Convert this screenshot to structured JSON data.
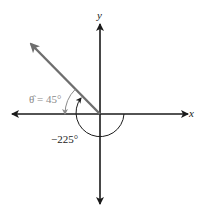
{
  "diagram": {
    "title": "",
    "x_axis_label": "x",
    "y_axis_label": "y",
    "terminal_angle_deg": -225,
    "reference_angle_deg": 45,
    "reference_label": "θ̂ = 45°",
    "angle_label": "−225°",
    "colors": {
      "axes": "#1a1a1a",
      "ray": "#6e6e6e",
      "reference": "#8a8a8a",
      "angle_arc": "#1a1a1a"
    }
  }
}
